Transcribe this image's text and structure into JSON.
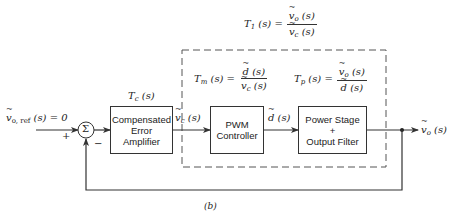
{
  "diagram": {
    "type": "feedback-control-block-diagram",
    "caption": "(b)",
    "input": {
      "label": "ṽo, ref (s) = 0",
      "sign_plus": "+",
      "sign_minus": "−"
    },
    "summing_junction": {
      "symbol": "Σ"
    },
    "blocks": [
      {
        "id": "comp",
        "label_lines": [
          "Compensated",
          "Error",
          "Amplifier"
        ],
        "transfer_fn": "Tc (s)"
      },
      {
        "id": "pwm",
        "label_lines": [
          "PWM",
          "Controller"
        ]
      },
      {
        "id": "power",
        "label_lines": [
          "Power Stage",
          "+",
          "Output Filter"
        ]
      }
    ],
    "signals": {
      "vc": "ṽc (s)",
      "d": "d̃ (s)",
      "vo": "ṽo (s)"
    },
    "equations": {
      "T1": {
        "lhs": "T1 (s) =",
        "num": "ṽo (s)",
        "den": "ṽc (s)"
      },
      "Tm": {
        "lhs": "Tm (s) =",
        "num": "d̃ (s)",
        "den": "ṽc (s)"
      },
      "Tp": {
        "lhs": "Tp (s) =",
        "num": "ṽo (s)",
        "den": "d̃ (s)"
      }
    },
    "nodes": [
      "v_o,ref",
      "sum",
      "comp",
      "pwm",
      "power",
      "v_o"
    ],
    "edges": [
      [
        "v_o,ref",
        "sum",
        "+"
      ],
      [
        "sum",
        "comp"
      ],
      [
        "comp",
        "pwm",
        "v_c(s)"
      ],
      [
        "pwm",
        "power",
        "d(s)"
      ],
      [
        "power",
        "v_o",
        "v_o(s)"
      ],
      [
        "v_o",
        "sum",
        "− (feedback)"
      ]
    ]
  },
  "text": {
    "input_v": "v",
    "input_sub": "o, ref",
    "input_rest": " (s) = 0",
    "plus": "+",
    "minus": "−",
    "sigma": "Σ",
    "tc_T": "T",
    "tc_sub": "c",
    "tc_rest": " (s)",
    "comp_l1": "Compensated",
    "comp_l2": "Error",
    "comp_l3": "Amplifier",
    "pwm_l1": "PWM",
    "pwm_l2": "Controller",
    "power_l1": "Power Stage",
    "power_l2": "+",
    "power_l3": "Output Filter",
    "v": "v",
    "d": "d",
    "c": "c",
    "o": "o",
    "s": " (s)",
    "T": "T",
    "one": "1",
    "m": "m",
    "p": "p",
    "eq": " (s) =",
    "caption": "(b)"
  }
}
